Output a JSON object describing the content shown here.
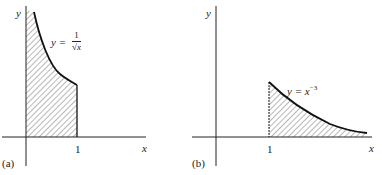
{
  "figure": {
    "panels": [
      {
        "id": "a",
        "label": "(a)",
        "x_axis_label": "x",
        "y_axis_label": "y",
        "tick_label": "1",
        "equation_lhs": "y =",
        "equation_num": "1",
        "equation_den": "√x",
        "description": "Shaded region under y = 1/√x from x = 0 to x = 1"
      },
      {
        "id": "b",
        "label": "(b)",
        "x_axis_label": "x",
        "y_axis_label": "y",
        "tick_label": "1",
        "equation_base": "y = x",
        "equation_exp": "−3",
        "description": "Shaded region under y = x^-3 from x = 1 to infinity"
      }
    ],
    "colors": {
      "ink": "#222222",
      "background": "#ffffff"
    }
  }
}
